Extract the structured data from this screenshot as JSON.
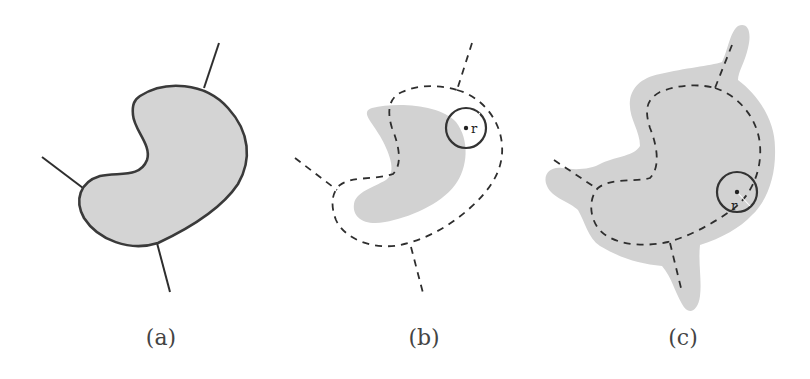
{
  "figure": {
    "panels": [
      {
        "id": "a",
        "caption": "(a)",
        "description": "Kidney-shaped region with solid outline and three solid skeleton branch lines"
      },
      {
        "id": "b",
        "caption": "(b)",
        "description": "Eroded grey region with dashed medial curve and probe circle of radius r",
        "radius_label": "r"
      },
      {
        "id": "c",
        "caption": "(c)",
        "description": "Dilated grey region enclosing dashed skeleton curve with probe circle of radius r",
        "radius_label": "r"
      }
    ],
    "colors": {
      "region_fill": "#d2d2d2",
      "stroke": "#2e2e2e",
      "background": "#ffffff"
    }
  }
}
